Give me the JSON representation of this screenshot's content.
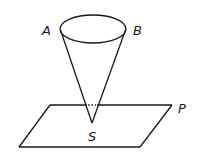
{
  "diagram": {
    "labels": {
      "A": "A",
      "B": "B",
      "S": "S",
      "P": "P"
    },
    "hidden_segment_style": "dotted",
    "stroke_color": "#1a1a1a",
    "background": "#ffffff"
  }
}
